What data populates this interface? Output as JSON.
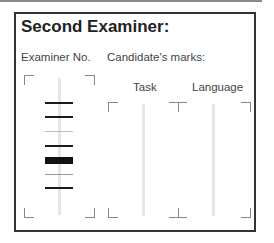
{
  "title": "Second Examiner:",
  "labels": {
    "examiner_no": "Examiner No.",
    "candidates_marks": "Candidate's marks:",
    "task": "Task",
    "language": "Language"
  },
  "examiner_barcode": {
    "bars": [
      {
        "y": 102,
        "h": 2,
        "color": "#1a1a1a"
      },
      {
        "y": 116,
        "h": 2,
        "color": "#1a1a1a"
      },
      {
        "y": 131,
        "h": 1,
        "color": "#bbbbbb"
      },
      {
        "y": 145,
        "h": 2,
        "color": "#1a1a1a"
      },
      {
        "y": 157,
        "h": 7,
        "color": "#111111"
      },
      {
        "y": 174,
        "h": 1,
        "color": "#999999"
      },
      {
        "y": 187,
        "h": 2,
        "color": "#1a1a1a"
      }
    ]
  },
  "marks": {
    "task": "",
    "language": ""
  }
}
